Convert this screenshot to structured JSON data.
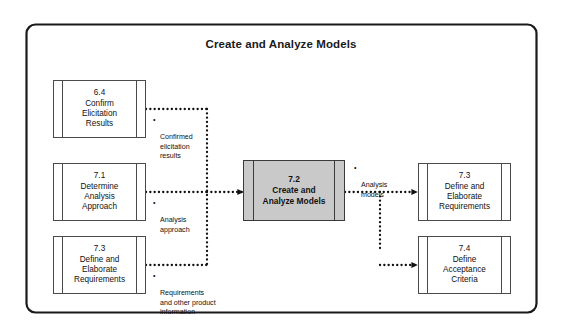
{
  "diagram": {
    "title": "Create and Analyze Models",
    "frame_name": "process-frame",
    "colors": {
      "frame_border": "#1a1a1a",
      "box_border": "#4a4a4a",
      "shaded_fill": "#c9c9c9",
      "connector": "#111111",
      "text": "#111111"
    }
  },
  "inputs": [
    {
      "id": "6.4",
      "number": "6.4",
      "name": "Confirm Elicitation Results",
      "label": "6.4\nConfirm\nElicitation\nResults"
    },
    {
      "id": "7.1",
      "number": "7.1",
      "name": "Determine Analysis Approach",
      "label": "7.1\nDetermine\nAnalysis\nApproach"
    },
    {
      "id": "7.3",
      "number": "7.3",
      "name": "Define and Elaborate Requirements",
      "label": "7.3\nDefine and\nElaborate\nRequirements"
    }
  ],
  "center": {
    "id": "7.2",
    "number": "7.2",
    "name": "Create and Analyze Models",
    "label": "7.2\nCreate and\nAnalyze Models"
  },
  "outputs": [
    {
      "id": "7.3",
      "number": "7.3",
      "name": "Define and Elaborate Requirements",
      "label": "7.3\nDefine and\nElaborate\nRequirements"
    },
    {
      "id": "7.4",
      "number": "7.4",
      "name": "Define Acceptance Criteria",
      "label": "7.4\nDefine\nAcceptance\nCriteria"
    }
  ],
  "flow_notes": {
    "bullet_glyph": "•",
    "input_1": "Confirmed\nelicitation\nresults",
    "input_2": "Analysis\napproach",
    "input_3": "Requirements\nand other product\ninformation",
    "output_1": "Analysis\nmodels"
  }
}
